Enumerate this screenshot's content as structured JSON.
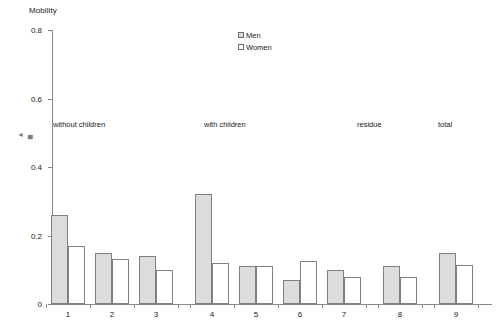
{
  "chart_data": {
    "type": "bar",
    "title": "",
    "ylabel": "Mobility",
    "xlabel": "",
    "ylim": [
      0,
      0.8
    ],
    "y_ticks": [
      0,
      0.2,
      0.4,
      0.6,
      0.8
    ],
    "y_tick_labels": [
      "0",
      "0.2",
      "0.4",
      "0.6",
      "0.8"
    ],
    "grid": false,
    "legend_position": "top-center",
    "categories": [
      "1",
      "2",
      "3",
      "4",
      "5",
      "6",
      "7",
      "8",
      "9"
    ],
    "series": [
      {
        "name": "Men",
        "values": [
          0.26,
          0.15,
          0.14,
          0.32,
          0.11,
          0.07,
          0.1,
          0.11,
          0.15
        ]
      },
      {
        "name": "Women",
        "values": [
          0.17,
          0.13,
          0.1,
          0.12,
          0.11,
          0.125,
          0.08,
          0.08,
          0.115
        ]
      }
    ],
    "annotations": [
      {
        "text": "without children",
        "categories": [
          "1",
          "2",
          "3"
        ]
      },
      {
        "text": "with children",
        "categories": [
          "4",
          "5",
          "6",
          "7"
        ]
      },
      {
        "text": "residue",
        "categories": [
          "8"
        ]
      },
      {
        "text": "total",
        "categories": [
          "9"
        ]
      }
    ],
    "colors": {
      "men_fill": "#dcdcdc",
      "women_fill": "#ffffff",
      "bar_stroke": "#808080",
      "axis": "#8a8a8a",
      "text": "#1a1a1a"
    }
  },
  "artifact": {
    "mark": "◄ ▄"
  }
}
